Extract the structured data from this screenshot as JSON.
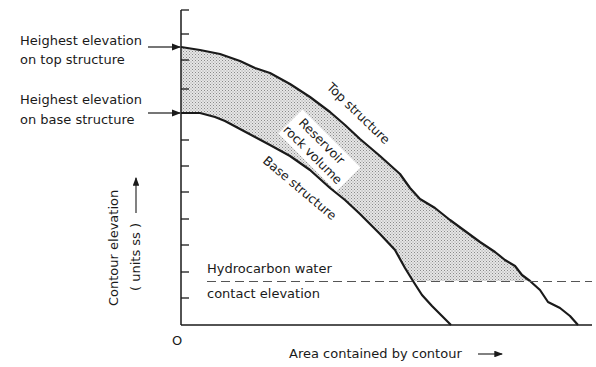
{
  "diagram": {
    "title": "",
    "left_labels": {
      "top_elevation": {
        "line1": "Heighest elevation",
        "line2": "on top structure"
      },
      "base_elevation": {
        "line1": "Heighest elevation",
        "line2": "on base structure"
      }
    },
    "curve_labels": {
      "top_structure": "Top structure",
      "base_structure": "Base structure",
      "reservoir_line1": "Reservoir",
      "reservoir_line2": "rock volume"
    },
    "contact": {
      "line1": "Hydrocarbon water",
      "line2": "contact elevation"
    },
    "axes": {
      "origin": "O",
      "xlabel": "Area contained by contour",
      "ylabel_line1": "Contour elevation",
      "ylabel_line2": "( units  ss )"
    },
    "colors": {
      "ink": "#1a1a1a",
      "fill": "#cfcfcf",
      "dash": "#555555"
    }
  }
}
